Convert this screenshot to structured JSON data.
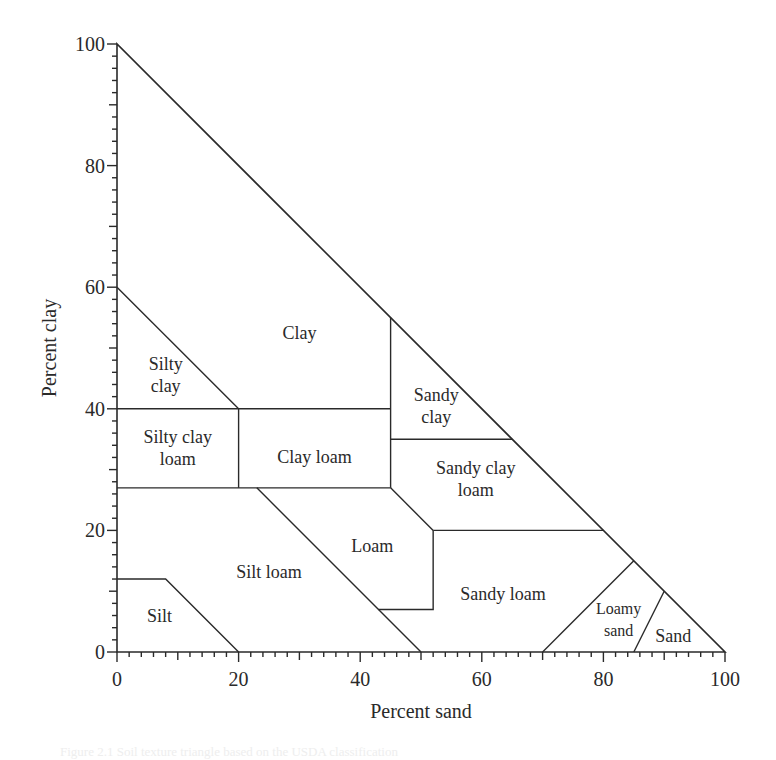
{
  "chart_data": {
    "type": "ternary-texture-triangle",
    "title": "",
    "xlabel": "Percent sand",
    "ylabel": "Percent clay",
    "xlim": [
      0,
      100
    ],
    "ylim": [
      0,
      100
    ],
    "x_ticks": [
      0,
      20,
      40,
      60,
      80,
      100
    ],
    "y_ticks": [
      0,
      20,
      40,
      60,
      80,
      100
    ],
    "minor_tick_step": 2,
    "grid": false,
    "legend": null,
    "outer_triangle": [
      [
        0,
        100
      ],
      [
        0,
        0
      ],
      [
        100,
        0
      ]
    ],
    "boundaries": [
      {
        "name": "silty-clay-diagonal",
        "points": [
          [
            0,
            60
          ],
          [
            20,
            40
          ]
        ]
      },
      {
        "name": "clay-sandy-clay-vertical",
        "points": [
          [
            45,
            55
          ],
          [
            45,
            27
          ]
        ]
      },
      {
        "name": "clay-40-horizontal",
        "points": [
          [
            0,
            40
          ],
          [
            45,
            40
          ]
        ]
      },
      {
        "name": "silty-clay-loam-vertical",
        "points": [
          [
            20,
            40
          ],
          [
            20,
            27
          ]
        ]
      },
      {
        "name": "loam-27-horizontal",
        "points": [
          [
            0,
            27
          ],
          [
            45,
            27
          ]
        ]
      },
      {
        "name": "sandy-clay-35-horizontal",
        "points": [
          [
            45,
            35
          ],
          [
            65,
            35
          ]
        ]
      },
      {
        "name": "loam-scl-diagonal",
        "points": [
          [
            45,
            27
          ],
          [
            52,
            20
          ]
        ]
      },
      {
        "name": "sandy-loam-20-horizontal",
        "points": [
          [
            52,
            20
          ],
          [
            80,
            20
          ]
        ]
      },
      {
        "name": "loam-sandy-loam-step",
        "points": [
          [
            52,
            20
          ],
          [
            52,
            7
          ],
          [
            43,
            7
          ]
        ]
      },
      {
        "name": "silt-loam-loam-diagonal",
        "points": [
          [
            23,
            27
          ],
          [
            50,
            0
          ]
        ]
      },
      {
        "name": "silt-boundary",
        "points": [
          [
            0,
            12
          ],
          [
            8,
            12
          ],
          [
            20,
            0
          ]
        ]
      },
      {
        "name": "loamy-sand-boundary",
        "points": [
          [
            70,
            0
          ],
          [
            85,
            15
          ]
        ]
      },
      {
        "name": "sand-boundary",
        "points": [
          [
            85,
            0
          ],
          [
            90,
            10
          ]
        ]
      }
    ],
    "regions": [
      {
        "name": "Clay",
        "lines": [
          "Clay"
        ],
        "at": [
          30,
          52.5
        ]
      },
      {
        "name": "Silty clay",
        "lines": [
          "Silty",
          "clay"
        ],
        "at": [
          8,
          45.5
        ]
      },
      {
        "name": "Sandy clay",
        "lines": [
          "Sandy",
          "clay"
        ],
        "at": [
          52.5,
          40.5
        ]
      },
      {
        "name": "Silty clay loam",
        "lines": [
          "Silty clay",
          "loam"
        ],
        "at": [
          10,
          33.5
        ]
      },
      {
        "name": "Clay loam",
        "lines": [
          "Clay loam"
        ],
        "at": [
          32.5,
          32
        ]
      },
      {
        "name": "Sandy clay loam",
        "lines": [
          "Sandy clay",
          "loam"
        ],
        "at": [
          59,
          28.5
        ]
      },
      {
        "name": "Loam",
        "lines": [
          "Loam"
        ],
        "at": [
          42,
          17.5
        ]
      },
      {
        "name": "Silt loam",
        "lines": [
          "Silt loam"
        ],
        "at": [
          25,
          13.2
        ]
      },
      {
        "name": "Silt",
        "lines": [
          "Silt"
        ],
        "at": [
          7,
          6
        ]
      },
      {
        "name": "Sandy loam",
        "lines": [
          "Sandy loam"
        ],
        "at": [
          63.5,
          9.5
        ]
      },
      {
        "name": "Loamy sand",
        "lines": [
          "Loamy",
          "sand"
        ],
        "at": [
          82.5,
          5.5
        ]
      },
      {
        "name": "Sand",
        "lines": [
          "Sand"
        ],
        "at": [
          91.5,
          2.7
        ]
      }
    ]
  },
  "layout": {
    "origin_px": [
      117,
      652
    ],
    "px_per_unit": 6.08,
    "line_color": "#2a2a2a",
    "background": "#ffffff"
  },
  "caption": "Figure 2.1  Soil texture triangle based on the USDA classification"
}
